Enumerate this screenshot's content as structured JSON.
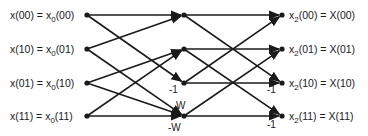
{
  "diagram": {
    "type": "fft-flow-graph",
    "inputs": [
      {
        "lhs": "x(00)",
        "rhs_base": "x",
        "rhs_sub": "0",
        "rhs_arg": "(00)"
      },
      {
        "lhs": "x(10)",
        "rhs_base": "x",
        "rhs_sub": "0",
        "rhs_arg": "(01)"
      },
      {
        "lhs": "x(01)",
        "rhs_base": "x",
        "rhs_sub": "0",
        "rhs_arg": "(10)"
      },
      {
        "lhs": "x(11)",
        "rhs_base": "x",
        "rhs_sub": "0",
        "rhs_arg": "(11)"
      }
    ],
    "outputs": [
      {
        "lhs_base": "x",
        "lhs_sub": "2",
        "lhs_arg": "(00)",
        "rhs": "X(00)"
      },
      {
        "lhs_base": "x",
        "lhs_sub": "2",
        "lhs_arg": "(01)",
        "rhs": "X(01)"
      },
      {
        "lhs_base": "x",
        "lhs_sub": "2",
        "lhs_arg": "(10)",
        "rhs": "X(10)"
      },
      {
        "lhs_base": "x",
        "lhs_sub": "2",
        "lhs_arg": "(11)",
        "rhs": "X(11)"
      }
    ],
    "equals": "=",
    "stage1_weights": {
      "node2": "-1",
      "node3_top": "W",
      "node3_bottom": "-W"
    },
    "stage2_weights": {
      "node2": "-1",
      "node3": "-1"
    },
    "edges_stage1": [
      [
        0,
        0
      ],
      [
        0,
        2
      ],
      [
        1,
        0
      ],
      [
        1,
        3
      ],
      [
        2,
        1
      ],
      [
        2,
        3
      ],
      [
        3,
        1
      ],
      [
        3,
        3
      ]
    ],
    "edges_stage2": [
      [
        0,
        0
      ],
      [
        0,
        2
      ],
      [
        1,
        1
      ],
      [
        1,
        3
      ],
      [
        2,
        0
      ],
      [
        2,
        2
      ],
      [
        3,
        1
      ],
      [
        3,
        3
      ]
    ]
  }
}
